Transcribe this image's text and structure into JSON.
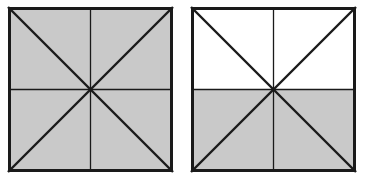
{
  "figure": {
    "background_color": "#ffffff",
    "canvas": {
      "width": 365,
      "height": 188
    },
    "shade_color": "#c9c9c9",
    "line_color": "#1a1a1a",
    "unshaded_color": "#ffffff",
    "border_width": 3,
    "diagonal_width": 2.4,
    "midline_width": 1.3,
    "shapes": [
      {
        "id": "left-square",
        "label": "Left square",
        "x": 8,
        "y": 7,
        "size": 165,
        "divisions": 8,
        "shaded_count": 8,
        "fraction_shaded": "8/8",
        "shaded_segments": [
          "top-left-upper",
          "top-left-lower",
          "top-right-upper",
          "top-right-lower",
          "bottom-right-upper",
          "bottom-right-lower",
          "bottom-left-upper",
          "bottom-left-lower"
        ]
      },
      {
        "id": "right-square",
        "label": "Right square",
        "x": 191,
        "y": 7,
        "size": 165,
        "divisions": 8,
        "shaded_count": 4,
        "fraction_shaded": "4/8",
        "shaded_segments": [
          "bottom-right-upper",
          "bottom-right-lower",
          "bottom-left-upper",
          "bottom-left-lower"
        ]
      }
    ]
  }
}
